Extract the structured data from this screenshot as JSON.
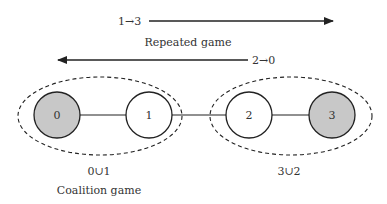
{
  "diagram": {
    "top_arrow": {
      "label": "1→3",
      "direction": "right"
    },
    "caption_repeated": "Repeated game",
    "bottom_arrow": {
      "label": "2→0",
      "direction": "left"
    },
    "nodes": [
      {
        "id": "0",
        "label": "0",
        "fill": "#c8c8c8"
      },
      {
        "id": "1",
        "label": "1",
        "fill": "#ffffff"
      },
      {
        "id": "2",
        "label": "2",
        "fill": "#ffffff"
      },
      {
        "id": "3",
        "label": "3",
        "fill": "#c8c8c8"
      }
    ],
    "coalitions": [
      {
        "label": "0∪1"
      },
      {
        "label": "3∪2"
      }
    ],
    "caption_coalition": "Coalition game",
    "colors": {
      "stroke": "#222222",
      "shaded": "#c8c8c8"
    }
  }
}
